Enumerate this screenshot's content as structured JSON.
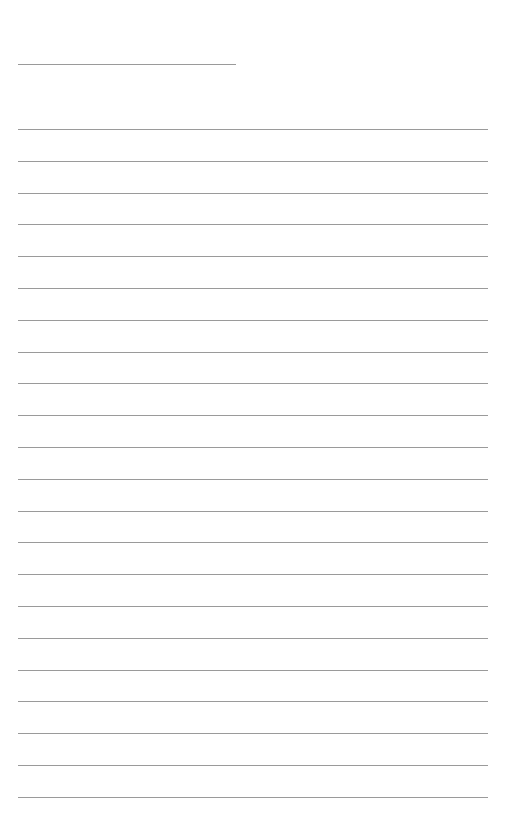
{
  "page": {
    "type": "blank lined writing sheet",
    "background": "#ffffff",
    "rule_color": "#9a9a9a",
    "header_line": {
      "y": 64,
      "x": 18,
      "width": 218
    },
    "lines": {
      "count": 22,
      "start_y": 129,
      "spacing": 31.8,
      "x": 18,
      "width": 470
    }
  }
}
